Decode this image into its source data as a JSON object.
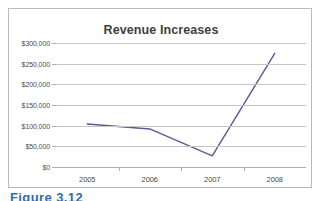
{
  "figure": {
    "caption": "Figure 3.12"
  },
  "chart_data": {
    "type": "line",
    "title": "Revenue Increases",
    "xlabel": "",
    "ylabel": "",
    "categories": [
      "2005",
      "2006",
      "2007",
      "2008"
    ],
    "series": [
      {
        "name": "Revenue",
        "values": [
          104000,
          92000,
          27000,
          275000
        ],
        "color": "#5a5a96"
      }
    ],
    "ylim": [
      0,
      300000
    ],
    "ytick_values": [
      0,
      50000,
      100000,
      150000,
      200000,
      250000,
      300000
    ],
    "ytick_labels": [
      "$0",
      "$50,000",
      "$100,000",
      "$150,000",
      "$200,000",
      "$250,000",
      "$300,000"
    ],
    "grid": true,
    "legend": "none",
    "markers": false,
    "gridline_color": "#c6c6c6",
    "axis_color": "#b0b0b0",
    "title_color": "#3f3f3f",
    "tick_label_color": "#4a4a4a",
    "plot_background": "#ffffff"
  }
}
